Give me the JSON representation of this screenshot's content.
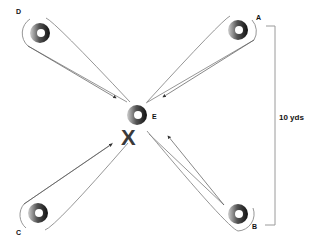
{
  "diagram": {
    "title": "",
    "cones": [
      {
        "id": "A",
        "label": "A",
        "x": 238,
        "y": 30
      },
      {
        "id": "B",
        "label": "B",
        "x": 238,
        "y": 214
      },
      {
        "id": "C",
        "label": "C",
        "x": 38,
        "y": 213
      },
      {
        "id": "D",
        "label": "D",
        "x": 40,
        "y": 33
      },
      {
        "id": "E",
        "label": "E",
        "x": 137,
        "y": 115
      }
    ],
    "labels": {
      "a": "A",
      "b": "B",
      "c": "C",
      "d": "D",
      "e": "E",
      "x_mark": "X",
      "distance": "10 yds"
    },
    "colors": {
      "cone_dark": "#1a1a1a",
      "cone_light": "#d0d0d0",
      "loop_stroke": "#8a8a8a",
      "bracket": "#9a9a9a",
      "x_mark": "#3a3a3a"
    }
  }
}
